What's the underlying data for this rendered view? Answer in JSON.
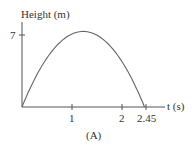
{
  "chart_data": {
    "type": "line",
    "title": "",
    "caption": "(A)",
    "xlabel": "t (s)",
    "ylabel": "Height (m)",
    "x_ticks": [
      "1",
      "2",
      "2.45"
    ],
    "y_ticks": [
      "7"
    ],
    "xlim": [
      0,
      2.6
    ],
    "ylim": [
      0,
      8
    ],
    "grid": false,
    "series": [
      {
        "name": "height",
        "x": [
          0,
          0.25,
          0.5,
          0.75,
          1.0,
          1.225,
          1.5,
          1.75,
          2.0,
          2.25,
          2.45
        ],
        "y": [
          0,
          2.69,
          4.78,
          6.27,
          7.15,
          7.35,
          7.06,
          6.0,
          4.41,
          2.21,
          0
        ]
      }
    ]
  },
  "labels": {
    "ylabel": "Height (m)",
    "ytick_7": "7",
    "xtick_1": "1",
    "xtick_2": "2",
    "xtick_245": "2.45",
    "xlabel": "t (s)",
    "caption": "(A)"
  }
}
